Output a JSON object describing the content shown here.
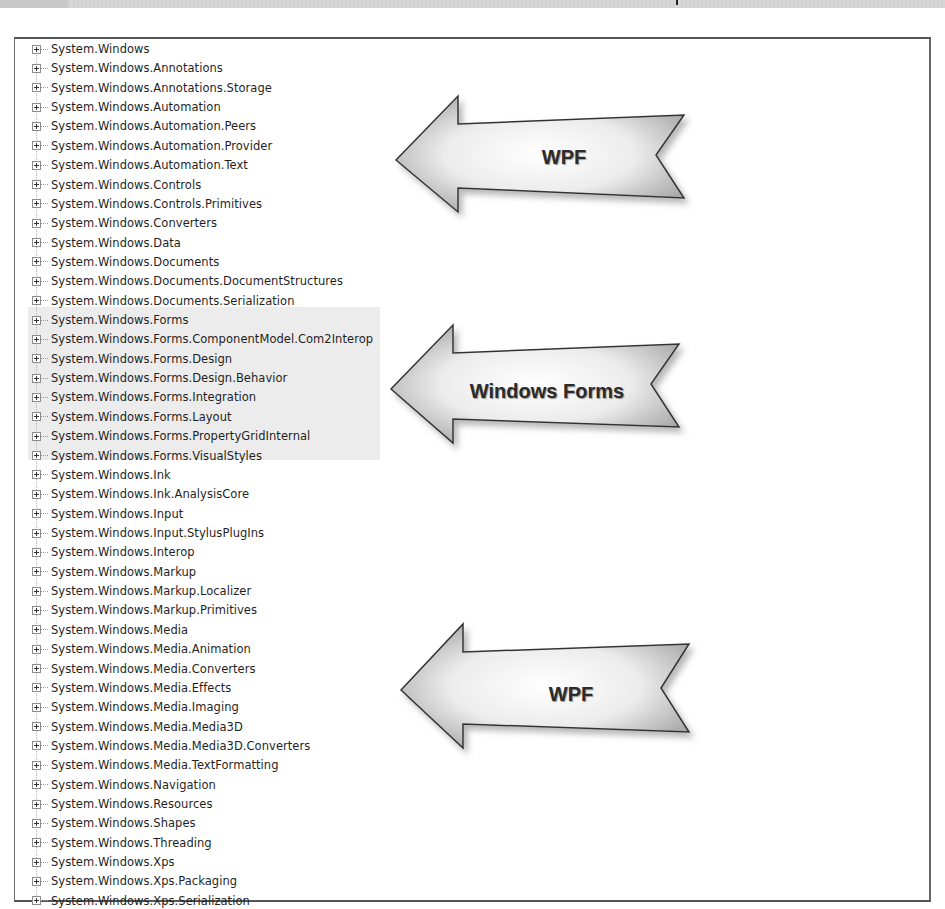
{
  "namespaces": [
    "System.Windows",
    "System.Windows.Annotations",
    "System.Windows.Annotations.Storage",
    "System.Windows.Automation",
    "System.Windows.Automation.Peers",
    "System.Windows.Automation.Provider",
    "System.Windows.Automation.Text",
    "System.Windows.Controls",
    "System.Windows.Controls.Primitives",
    "System.Windows.Converters",
    "System.Windows.Data",
    "System.Windows.Documents",
    "System.Windows.Documents.DocumentStructures",
    "System.Windows.Documents.Serialization",
    "System.Windows.Forms",
    "System.Windows.Forms.ComponentModel.Com2Interop",
    "System.Windows.Forms.Design",
    "System.Windows.Forms.Design.Behavior",
    "System.Windows.Forms.Integration",
    "System.Windows.Forms.Layout",
    "System.Windows.Forms.PropertyGridInternal",
    "System.Windows.Forms.VisualStyles",
    "System.Windows.Ink",
    "System.Windows.Ink.AnalysisCore",
    "System.Windows.Input",
    "System.Windows.Input.StylusPlugIns",
    "System.Windows.Interop",
    "System.Windows.Markup",
    "System.Windows.Markup.Localizer",
    "System.Windows.Markup.Primitives",
    "System.Windows.Media",
    "System.Windows.Media.Animation",
    "System.Windows.Media.Converters",
    "System.Windows.Media.Effects",
    "System.Windows.Media.Imaging",
    "System.Windows.Media.Media3D",
    "System.Windows.Media.Media3D.Converters",
    "System.Windows.Media.TextFormatting",
    "System.Windows.Navigation",
    "System.Windows.Resources",
    "System.Windows.Shapes",
    "System.Windows.Threading",
    "System.Windows.Xps",
    "System.Windows.Xps.Packaging",
    "System.Windows.Xps.Serialization"
  ],
  "highlight": {
    "group": "Windows Forms",
    "first_index": 14,
    "last_index": 21,
    "color": "#ececec"
  },
  "callouts": [
    {
      "label": "WPF",
      "points_to": "System.Windows ... System.Windows.Documents.Serialization"
    },
    {
      "label": "Windows Forms",
      "points_to": "System.Windows.Forms ... System.Windows.Forms.VisualStyles"
    },
    {
      "label": "WPF",
      "points_to": "System.Windows.Ink ... System.Windows.Xps.Serialization"
    }
  ],
  "icons": {
    "expander": "plus-box-expand-icon",
    "callout": "left-arrow-callout-icon"
  },
  "colors": {
    "border": "#555555",
    "text": "#1f1f1f",
    "arrow_fill_light": "#f4f4f4",
    "arrow_fill_dark": "#a8a8a8",
    "arrow_stroke": "#333333"
  }
}
